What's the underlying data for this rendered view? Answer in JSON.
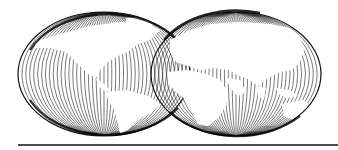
{
  "illustration": {
    "subject": "two overlapping hemisphere globes drawn with hatched meridian lines",
    "globes": [
      {
        "name": "western-hemisphere",
        "cx": 104,
        "cy": 74,
        "rx": 86,
        "ry": 62,
        "line_color": "#111111"
      },
      {
        "name": "eastern-hemisphere",
        "cx": 236,
        "cy": 74,
        "rx": 85,
        "ry": 62,
        "line_color": "#111111"
      }
    ],
    "baseline": {
      "x1": 18,
      "x2": 338,
      "y": 145,
      "color": "#111111"
    },
    "background": "#ffffff"
  }
}
